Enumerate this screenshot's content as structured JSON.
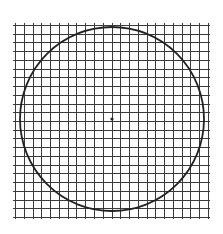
{
  "diagram": {
    "canvas": {
      "width": 223,
      "height": 234,
      "background": "#ffffff"
    },
    "grid": {
      "x0": 15,
      "y0": 25,
      "x1": 208,
      "y1": 217,
      "cells_x": 22,
      "cells_y": 22,
      "overhang": 2,
      "line_color": "#3a3a3a",
      "line_width": 1
    },
    "circle": {
      "cx": 112,
      "cy": 119,
      "r": 92,
      "stroke": "#222222",
      "stroke_width": 1.8
    },
    "center_point": {
      "cx": 112,
      "cy": 119,
      "r": 1.6,
      "fill": "#222222"
    }
  }
}
